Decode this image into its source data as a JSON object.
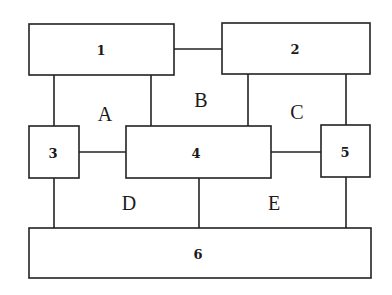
{
  "diagram": {
    "boxes": [
      {
        "id": "1",
        "label": "1"
      },
      {
        "id": "2",
        "label": "2"
      },
      {
        "id": "3",
        "label": "3"
      },
      {
        "id": "4",
        "label": "4"
      },
      {
        "id": "5",
        "label": "5"
      },
      {
        "id": "6",
        "label": "6"
      }
    ],
    "regions": [
      {
        "id": "A",
        "label": "A"
      },
      {
        "id": "B",
        "label": "B"
      },
      {
        "id": "C",
        "label": "C"
      },
      {
        "id": "D",
        "label": "D"
      },
      {
        "id": "E",
        "label": "E"
      }
    ],
    "connections": [
      [
        "1",
        "2"
      ],
      [
        "1",
        "3"
      ],
      [
        "1",
        "4"
      ],
      [
        "2",
        "4"
      ],
      [
        "2",
        "5"
      ],
      [
        "3",
        "4"
      ],
      [
        "4",
        "5"
      ],
      [
        "3",
        "6"
      ],
      [
        "4",
        "6"
      ],
      [
        "5",
        "6"
      ]
    ]
  }
}
